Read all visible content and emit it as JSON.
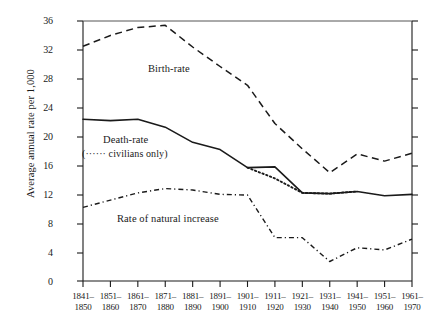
{
  "chart_data": {
    "type": "line",
    "title": "",
    "xlabel": "",
    "ylabel": "Average annual rate per 1,000",
    "ylim": [
      0,
      36
    ],
    "yticks": [
      0,
      4,
      8,
      12,
      16,
      20,
      24,
      28,
      32,
      36
    ],
    "grid": false,
    "legend": "inline-annotations",
    "categories": [
      "1841–1850",
      "1851–1860",
      "1861–1870",
      "1871–1880",
      "1881–1890",
      "1891–1900",
      "1901–1910",
      "1911–1920",
      "1921–1930",
      "1931–1940",
      "1941–1950",
      "1951–1960",
      "1961–1970"
    ],
    "categories_top": [
      "1841–",
      "1851–",
      "1861–",
      "1871–",
      "1881–",
      "1891–",
      "1901–",
      "1911–",
      "1921–",
      "1931–",
      "1941–",
      "1951–",
      "1961–"
    ],
    "categories_bottom": [
      "1850",
      "1860",
      "1870",
      "1880",
      "1890",
      "1900",
      "1910",
      "1920",
      "1930",
      "1940",
      "1950",
      "1960",
      "1970"
    ],
    "series": [
      {
        "name": "Birth-rate",
        "style": "dashed",
        "values": [
          32.5,
          34.0,
          35.1,
          35.4,
          32.4,
          29.7,
          27.1,
          21.8,
          18.3,
          15.0,
          17.6,
          16.6,
          17.7
        ]
      },
      {
        "name": "Death-rate",
        "style": "solid",
        "values": [
          22.4,
          22.2,
          22.4,
          21.3,
          19.2,
          18.2,
          15.7,
          15.8,
          12.2,
          12.1,
          12.4,
          11.8,
          12.0
        ]
      },
      {
        "name": "Death-rate (civilians only)",
        "style": "dotted",
        "values": [
          null,
          null,
          null,
          null,
          null,
          null,
          15.7,
          14.2,
          12.2,
          12.1,
          12.4,
          null,
          null
        ]
      },
      {
        "name": "Rate of natural increase",
        "style": "dash-dot",
        "values": [
          10.2,
          11.2,
          12.2,
          12.8,
          12.6,
          12.0,
          11.9,
          6.0,
          6.0,
          2.7,
          4.6,
          4.3,
          5.8
        ]
      }
    ],
    "annotations": [
      {
        "name": "birth-rate-label",
        "text": "Birth-rate"
      },
      {
        "name": "death-rate-label",
        "text": "Death-rate"
      },
      {
        "name": "death-rate-civilians-label",
        "text": "(······ civilians only)"
      },
      {
        "name": "natural-increase-label",
        "text": "Rate of natural increase"
      }
    ],
    "colors": {
      "axis": "#1a1a1a",
      "birth_rate": "#1a1a1a",
      "death_rate": "#1a1a1a",
      "civilians": "#1a1a1a",
      "natural_increase": "#1a1a1a",
      "background": "#ffffff"
    }
  }
}
